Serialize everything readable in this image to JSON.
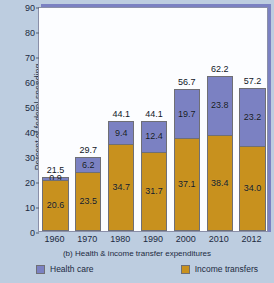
{
  "chart_data": {
    "type": "bar",
    "subtype": "stacked-vertical",
    "title": "",
    "caption": "(b) Health & income transfer expenditures",
    "xlabel": "",
    "ylabel": "Percent of federal spending",
    "categories": [
      "1960",
      "1970",
      "1980",
      "1990",
      "2000",
      "2010",
      "2012"
    ],
    "series": [
      {
        "name": "Health care",
        "color": "#7b81c2",
        "values": [
          0.9,
          6.2,
          9.4,
          12.4,
          19.7,
          23.8,
          23.2
        ]
      },
      {
        "name": "Income transfers",
        "color": "#c8911e",
        "values": [
          20.6,
          23.5,
          34.7,
          31.7,
          37.1,
          38.4,
          34.0
        ]
      }
    ],
    "totals": [
      21.5,
      29.7,
      44.1,
      44.1,
      56.7,
      62.2,
      57.2
    ],
    "ylim": [
      0,
      90
    ],
    "yticks": [
      0,
      10,
      20,
      30,
      40,
      50,
      60,
      70,
      80,
      90
    ],
    "ytick_labels": [
      "0",
      "10",
      "20",
      "30",
      "40",
      "50",
      "60",
      "70",
      "80",
      "90"
    ],
    "grid": false,
    "legend_position": "bottom",
    "legend": [
      {
        "label": "Health care",
        "color": "#7b81c2"
      },
      {
        "label": "Income transfers",
        "color": "#c8911e"
      }
    ],
    "background_color": "#bdcde0",
    "plot_background_color": "#fcfdff"
  }
}
